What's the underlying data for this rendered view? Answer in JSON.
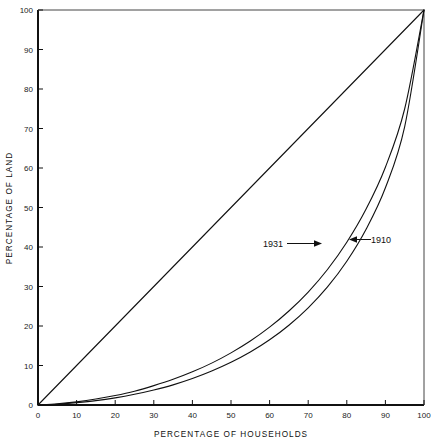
{
  "chart_data": {
    "type": "line",
    "title": "",
    "xlabel": "PERCENTAGE OF HOUSEHOLDS",
    "ylabel": "PERCENTAGE OF LAND",
    "xlim": [
      0,
      100
    ],
    "ylim": [
      0,
      100
    ],
    "grid": false,
    "legend_position": "inline-annotations",
    "xticks": [
      0,
      10,
      20,
      30,
      40,
      50,
      60,
      70,
      80,
      90,
      100
    ],
    "yticks": [
      0,
      10,
      20,
      30,
      40,
      50,
      60,
      70,
      80,
      90,
      100
    ],
    "xtick_labels": [
      "0",
      "10",
      "20",
      "30",
      "40",
      "50",
      "60",
      "70",
      "80",
      "90",
      "100"
    ],
    "ytick_labels": [
      "0",
      "10",
      "20",
      "30",
      "40",
      "50",
      "60",
      "70",
      "80",
      "90",
      "100"
    ],
    "series": [
      {
        "name": "equality-line",
        "label": "",
        "x": [
          0,
          100
        ],
        "values": [
          0,
          100
        ]
      },
      {
        "name": "1931",
        "label": "1931",
        "x": [
          0,
          5,
          10,
          15,
          20,
          25,
          30,
          35,
          40,
          45,
          50,
          55,
          60,
          65,
          70,
          75,
          80,
          85,
          90,
          95,
          100
        ],
        "values": [
          0,
          0.3,
          0.8,
          1.5,
          2.4,
          3.5,
          4.9,
          6.5,
          8.4,
          10.6,
          13.2,
          16.2,
          19.7,
          23.8,
          28.6,
          34.3,
          41.2,
          49.6,
          60.2,
          75.0,
          100
        ]
      },
      {
        "name": "1910",
        "label": "1910",
        "x": [
          0,
          5,
          10,
          15,
          20,
          25,
          30,
          35,
          40,
          45,
          50,
          55,
          60,
          65,
          70,
          75,
          80,
          85,
          90,
          95,
          100
        ],
        "values": [
          0,
          0.2,
          0.6,
          1.1,
          1.8,
          2.7,
          3.8,
          5.1,
          6.7,
          8.6,
          10.8,
          13.4,
          16.5,
          20.2,
          24.6,
          29.9,
          36.4,
          44.5,
          55.0,
          70.5,
          100
        ]
      }
    ],
    "annotations": [
      {
        "name": "annotation-1931",
        "text": "1931",
        "arrow": "right",
        "x": 69,
        "y": 42
      },
      {
        "name": "annotation-1910",
        "text": "1910",
        "arrow": "left",
        "x": 85,
        "y": 43
      }
    ]
  }
}
